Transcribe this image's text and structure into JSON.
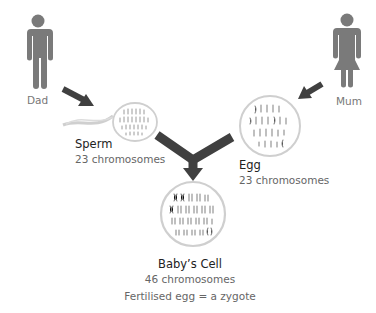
{
  "colors": {
    "figure": "#7a7a7a",
    "arrow": "#404040",
    "cell_outline": "#cfcfcf",
    "chromosome": "#9a9a9a"
  },
  "parents": {
    "dad": {
      "label": "Dad",
      "icon": "male-person-icon"
    },
    "mum": {
      "label": "Mum",
      "icon": "female-person-icon"
    }
  },
  "cells": {
    "sperm": {
      "title": "Sperm",
      "subtitle": "23 chromosomes"
    },
    "egg": {
      "title": "Egg",
      "subtitle": "23 chromosomes"
    },
    "baby": {
      "title": "Baby’s Cell",
      "subtitle": "46 chromosomes",
      "note": "Fertilised egg = a zygote"
    }
  }
}
